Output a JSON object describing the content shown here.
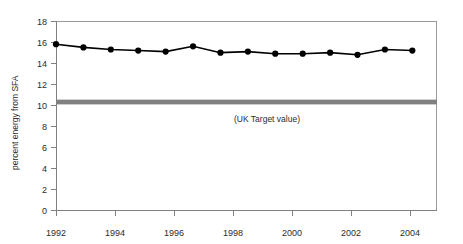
{
  "chart_data": {
    "type": "line",
    "title": "",
    "xlabel": "",
    "ylabel": "percent energy from SFA",
    "x": [
      1992,
      1993,
      1994,
      1995,
      1996,
      1997,
      1998,
      1999,
      2000,
      2001,
      2002,
      2003,
      2004,
      2005
    ],
    "values": [
      15.8,
      15.5,
      15.3,
      15.2,
      15.1,
      15.6,
      15.0,
      15.1,
      14.9,
      14.9,
      15.0,
      14.8,
      15.3,
      15.2
    ],
    "series": [
      {
        "name": "percent energy from SFA",
        "values": [
          15.8,
          15.5,
          15.3,
          15.2,
          15.1,
          15.6,
          15.0,
          15.1,
          14.9,
          14.9,
          15.0,
          14.8,
          15.3,
          15.2
        ],
        "color": "#000000",
        "marker": "filled-circle"
      }
    ],
    "xlim": [
      1992,
      1905.9
    ],
    "x_axis_min": 1992,
    "x_axis_max": 2005.9,
    "ylim": [
      0,
      18
    ],
    "y_ticks": [
      "18",
      "16",
      "14",
      "12",
      "10",
      "8",
      "6",
      "4",
      "2",
      "0"
    ],
    "y_tick_values": [
      18,
      16,
      14,
      12,
      10,
      8,
      6,
      4,
      2,
      0
    ],
    "x_ticks": [
      "1992",
      "1994",
      "1996",
      "1998",
      "2000",
      "2002",
      "2004"
    ],
    "x_tick_values": [
      1992,
      1994,
      1996,
      1998,
      2000,
      2002,
      2004
    ],
    "grid": false,
    "legend": "none",
    "annotations": [
      {
        "name": "uk-target-band",
        "label": "(UK Target value)",
        "type": "horizontal-band",
        "value": 10.3,
        "band_low": 10.1,
        "band_high": 10.55,
        "color": "#808080"
      }
    ]
  },
  "axis": {
    "y_title": "percent energy from SFA",
    "y_tick_labels": [
      "18",
      "16",
      "14",
      "12",
      "10",
      "8",
      "6",
      "4",
      "2",
      "0"
    ],
    "x_tick_labels": [
      "1992",
      "1994",
      "1996",
      "1998",
      "2000",
      "2002",
      "2004"
    ]
  },
  "annotation": {
    "target_label": "(UK Target value)"
  },
  "colors": {
    "series_line": "#000000",
    "marker": "#000000",
    "target_band": "#808080",
    "axis": "#808080",
    "plot_border": "#9a9a9a",
    "background": "#ffffff"
  }
}
